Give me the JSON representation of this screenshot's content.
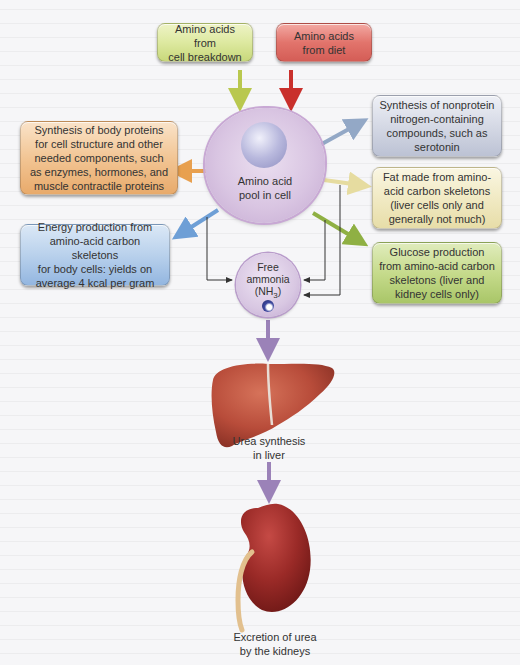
{
  "diagram": {
    "type": "flowchart",
    "topic": "Amino acid metabolism"
  },
  "sources": [
    {
      "id": "cell_breakdown",
      "label": "Amino acids from cell breakdown",
      "lines": [
        "Amino acids from",
        "cell breakdown"
      ],
      "color": "#dde9a0",
      "arrow_color": "#b9c84f"
    },
    {
      "id": "diet",
      "label": "Amino acids from diet",
      "lines": [
        "Amino acids",
        "from diet"
      ],
      "color": "#e2746c",
      "arrow_color": "#c9302c"
    }
  ],
  "pool": {
    "label": "Amino acid pool in cell",
    "lines": [
      "Amino acid",
      "pool in cell"
    ]
  },
  "outputs": [
    {
      "id": "nonprotein",
      "lines": [
        "Synthesis of nonprotein",
        "nitrogen-containing",
        "compounds, such as",
        "serotonin"
      ],
      "color": "#d5d9e5",
      "arrow_color": "#93a8c6"
    },
    {
      "id": "body_proteins",
      "lines": [
        "Synthesis of body proteins",
        "for cell structure and other",
        "needed components, such",
        "as enzymes, hormones, and",
        "muscle contractile proteins"
      ],
      "color": "#f2c594",
      "arrow_color": "#e8a04f"
    },
    {
      "id": "fat",
      "lines": [
        "Fat made from amino-",
        "acid carbon skeletons",
        "(liver cells only and",
        "generally not much)"
      ],
      "color": "#f1eac4",
      "arrow_color": "#e6dca0"
    },
    {
      "id": "energy",
      "lines": [
        "Energy production from",
        "amino-acid carbon skeletons",
        "for body cells: yields on",
        "average 4 kcal per gram"
      ],
      "color": "#b9d1ec",
      "arrow_color": "#6e9fd6"
    },
    {
      "id": "glucose",
      "lines": [
        "Glucose production",
        "from amino-acid carbon",
        "skeletons (liver and",
        "kidney cells only)"
      ],
      "color": "#c6db8c",
      "arrow_color": "#8fb043"
    }
  ],
  "ammonia": {
    "lines": [
      "Free",
      "ammonia"
    ],
    "formula_prefix": "(NH",
    "formula_sub": "3",
    "formula_suffix": ")"
  },
  "liver": {
    "lines": [
      "Urea synthesis",
      "in liver"
    ]
  },
  "kidney": {
    "lines": [
      "Excretion of urea",
      "by the kidneys"
    ]
  },
  "colors": {
    "flow_arrow": "#9b82b8",
    "connector_line": "#333333",
    "background": "#f6f6f8"
  }
}
